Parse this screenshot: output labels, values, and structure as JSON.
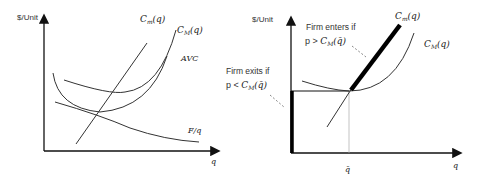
{
  "left_panel": {
    "y_axis_label": "$/Unit",
    "x_axis_label": "q",
    "curves": {
      "marginal_cost": "C_m(q)",
      "average_cost": "C_M(q)",
      "avc": "AVC",
      "fixed_per_unit": "F/q"
    },
    "labels": {
      "cm_base": "C",
      "cm_sub": "m",
      "cm_arg": "(q)",
      "cM_base": "C",
      "cM_sub": "M",
      "cM_arg": "(q)",
      "avc": "AVC",
      "fq": "F/q"
    }
  },
  "right_panel": {
    "y_axis_label": "$/Unit",
    "x_axis_label": "q",
    "qbar_label": "q̄",
    "labels": {
      "cm_base": "C",
      "cm_sub": "m",
      "cm_arg": "(q)",
      "cM_base": "C",
      "cM_sub": "M",
      "cM_arg": "(q)"
    },
    "enter_annotation": {
      "line1": "Firm enters if",
      "line2_prefix": "p > ",
      "line2_base": "C",
      "line2_sub": "M",
      "line2_arg": "(q̄)"
    },
    "exit_annotation": {
      "line1": "Firm exits if",
      "line2_prefix": "p < ",
      "line2_base": "C",
      "line2_sub": "M",
      "line2_arg": "(q̄)"
    }
  },
  "colors": {
    "axis": "#111111",
    "curve": "#333333",
    "supply": "#000000",
    "guide": "#aaaaaa"
  }
}
